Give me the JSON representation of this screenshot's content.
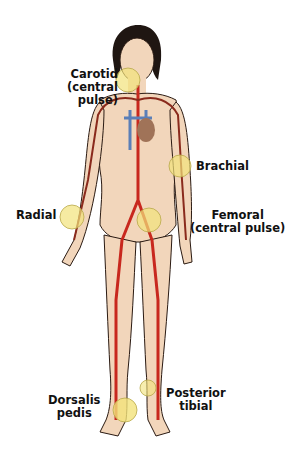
{
  "colors": {
    "skin": "#f2d6bb",
    "outline": "#2a1a12",
    "artery": "#c8281e",
    "artery_dark": "#8a2a1c",
    "vein": "#5a7fb8",
    "heart": "#a07358",
    "hair": "#1f1612",
    "pulse_marker": "#f2e27a"
  },
  "labels": {
    "carotid": "Carotid\n(central\npulse)",
    "brachial": "Brachial",
    "radial": "Radial",
    "femoral": "Femoral\n(central pulse)",
    "dorsalis_pedis": "Dorsalis\npedis",
    "posterior_tibial": "Posterior\ntibial"
  },
  "pulse_points": [
    {
      "name": "Carotid",
      "central": true
    },
    {
      "name": "Brachial",
      "central": false
    },
    {
      "name": "Radial",
      "central": false
    },
    {
      "name": "Femoral",
      "central": true
    },
    {
      "name": "Dorsalis pedis",
      "central": false
    },
    {
      "name": "Posterior tibial",
      "central": false
    }
  ]
}
